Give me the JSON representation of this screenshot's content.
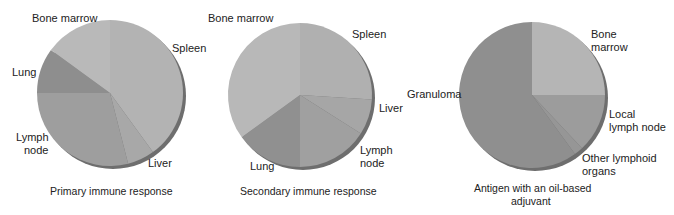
{
  "chart_data": [
    {
      "type": "pie",
      "title": "Primary immune response",
      "center": [
        110,
        93
      ],
      "radius": 73,
      "slices": [
        {
          "label": "Spleen",
          "value": 40,
          "color": "#b3b3b3"
        },
        {
          "label": "Liver",
          "value": 6,
          "color": "#a8a8a8"
        },
        {
          "label": "Lymph node",
          "value": 29,
          "color": "#9e9e9e"
        },
        {
          "label": "Lung",
          "value": 10,
          "color": "#8e8e8e"
        },
        {
          "label": "Bone marrow",
          "value": 15,
          "color": "#b9b9b9"
        }
      ]
    },
    {
      "type": "pie",
      "title": "Secondary immune response",
      "center": [
        300,
        95
      ],
      "radius": 72,
      "slices": [
        {
          "label": "Spleen",
          "value": 26,
          "color": "#b0b0b0"
        },
        {
          "label": "Liver",
          "value": 8,
          "color": "#a6a6a6"
        },
        {
          "label": "Lymph node",
          "value": 16,
          "color": "#a0a0a0"
        },
        {
          "label": "Lung",
          "value": 15,
          "color": "#909090"
        },
        {
          "label": "Bone marrow",
          "value": 35,
          "color": "#b8b8b8"
        }
      ]
    },
    {
      "type": "pie",
      "title": "Antigen with an oil-based adjuvant",
      "center": [
        532,
        95
      ],
      "radius": 73,
      "slices": [
        {
          "label": "Bone marrow",
          "value": 25,
          "color": "#b5b5b5"
        },
        {
          "label": "Local lymph node",
          "value": 13,
          "color": "#9c9c9c"
        },
        {
          "label": "Other lymphoid organs",
          "value": 2,
          "color": "#969696"
        },
        {
          "label": "Granuloma",
          "value": 60,
          "color": "#8f8f8f"
        }
      ]
    }
  ],
  "labels": {
    "p1": {
      "bone_marrow": "Bone marrow",
      "spleen": "Spleen",
      "lung": "Lung",
      "lymph1": "Lymph",
      "lymph2": "node",
      "liver": "Liver",
      "caption": "Primary immune response"
    },
    "p2": {
      "bone_marrow": "Bone marrow",
      "spleen": "Spleen",
      "liver": "Liver",
      "lymph1": "Lymph",
      "lymph2": "node",
      "lung": "Lung",
      "caption": "Secondary immune response"
    },
    "p3": {
      "bone1": "Bone",
      "bone2": "marrow",
      "granuloma": "Granuloma",
      "local1": "Local",
      "local2": "lymph node",
      "other1": "Other lymphoid",
      "other2": "organs",
      "caption1": "Antigen with an oil-based",
      "caption2": "adjuvant"
    }
  }
}
